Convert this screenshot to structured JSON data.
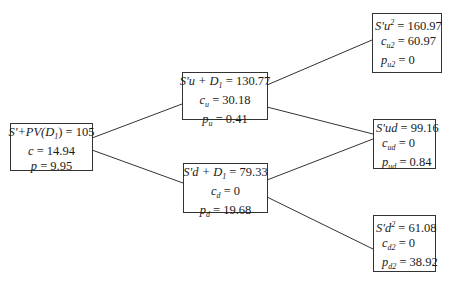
{
  "diagram": {
    "type": "binomial-option-tree",
    "line_color": "#333333",
    "nodes": {
      "root": {
        "price_label": "S'+PV(D",
        "price_sub": "1",
        "price_tail": ") = 105",
        "call_label": "c",
        "call_value": " = 14.94",
        "put_label": "p",
        "put_value": " = 9.95"
      },
      "up": {
        "price_label": "S'u + D",
        "price_sub": "1",
        "price_value": " = 130.77",
        "call_label": "c",
        "call_sub": "u",
        "call_value": " = 30.18",
        "put_label": "p",
        "put_sub": "u",
        "put_value": " = 0.41"
      },
      "down": {
        "price_label": "S'd + D",
        "price_sub": "1",
        "price_value": " = 79.33",
        "call_label": "c",
        "call_sub": "d",
        "call_value": " = 0",
        "put_label": "p",
        "put_sub": "d",
        "put_value": " = 19.68"
      },
      "upup": {
        "price_label": "S'u",
        "price_sup": "2",
        "price_value": " = 160.97",
        "call_label": "c",
        "call_sub": "u2",
        "call_value": " = 60.97",
        "put_label": "p",
        "put_sub": "u2",
        "put_value": " = 0"
      },
      "updown": {
        "price_label": "S'ud",
        "price_value": " = 99.16",
        "call_label": "c",
        "call_sub": "ud",
        "call_value": " = 0",
        "put_label": "p",
        "put_sub": "ud",
        "put_value": " = 0.84"
      },
      "downdown": {
        "price_label": "S'd",
        "price_sup": "2",
        "price_value": " = 61.08",
        "call_label": "c",
        "call_sub": "d2",
        "call_value": " = 0",
        "put_label": "p",
        "put_sub": "d2",
        "put_value": " = 38.92"
      }
    }
  }
}
